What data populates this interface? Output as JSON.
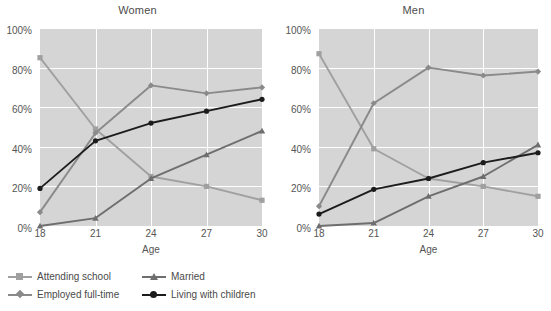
{
  "chart_data": [
    {
      "type": "line",
      "title": "Women",
      "xlabel": "Age",
      "ylabel": "",
      "x": [
        18,
        21,
        24,
        27,
        30
      ],
      "xticklabels": [
        "18",
        "21",
        "24",
        "27",
        "30"
      ],
      "yticklabels": [
        "0%",
        "20%",
        "40%",
        "60%",
        "80%",
        "100%"
      ],
      "yticks": [
        0,
        20,
        40,
        60,
        80,
        100
      ],
      "ylim": [
        0,
        100
      ],
      "grid": true,
      "legend_position": "bottom",
      "series": [
        {
          "name": "Attending school",
          "values": [
            85,
            49,
            25,
            20,
            13
          ],
          "color": "#a0a0a0",
          "marker": "square"
        },
        {
          "name": "Employed full-time",
          "values": [
            7,
            47,
            71,
            67,
            70
          ],
          "color": "#8a8a8a",
          "marker": "diamond"
        },
        {
          "name": "Married",
          "values": [
            0,
            4,
            24,
            36,
            48
          ],
          "color": "#6e6e6e",
          "marker": "triangle"
        },
        {
          "name": "Living with children",
          "values": [
            19,
            43,
            52,
            58,
            64
          ],
          "color": "#1c1c1c",
          "marker": "circle"
        }
      ]
    },
    {
      "type": "line",
      "title": "Men",
      "xlabel": "Age",
      "ylabel": "",
      "x": [
        18,
        21,
        24,
        27,
        30
      ],
      "xticklabels": [
        "18",
        "21",
        "24",
        "27",
        "30"
      ],
      "yticklabels": [
        "0%",
        "20%",
        "40%",
        "60%",
        "80%",
        "100%"
      ],
      "yticks": [
        0,
        20,
        40,
        60,
        80,
        100
      ],
      "ylim": [
        0,
        100
      ],
      "grid": true,
      "legend_position": "bottom",
      "series": [
        {
          "name": "Attending school",
          "values": [
            87,
            39,
            24,
            20,
            15
          ],
          "color": "#a0a0a0",
          "marker": "square"
        },
        {
          "name": "Employed full-time",
          "values": [
            10,
            62,
            80,
            76,
            78
          ],
          "color": "#8a8a8a",
          "marker": "diamond"
        },
        {
          "name": "Married",
          "values": [
            0,
            1.5,
            15,
            25,
            41
          ],
          "color": "#6e6e6e",
          "marker": "triangle"
        },
        {
          "name": "Living with children",
          "values": [
            6,
            18.5,
            24,
            32,
            37
          ],
          "color": "#1c1c1c",
          "marker": "circle"
        }
      ]
    }
  ],
  "panels": [
    {
      "title": "Women",
      "axis_title": "Age"
    },
    {
      "title": "Men",
      "axis_title": "Age"
    }
  ],
  "legend": {
    "items": [
      {
        "label": "Attending school",
        "color": "#a0a0a0",
        "marker": "square"
      },
      {
        "label": "Married",
        "color": "#6e6e6e",
        "marker": "triangle"
      },
      {
        "label": "Employed full-time",
        "color": "#8a8a8a",
        "marker": "diamond"
      },
      {
        "label": "Living with children",
        "color": "#1c1c1c",
        "marker": "circle"
      }
    ]
  },
  "colors": {
    "plot_background": "#d5d5d5",
    "gridline": "#ffffff",
    "page_background": "#ffffff",
    "text": "#4a4a4a"
  }
}
